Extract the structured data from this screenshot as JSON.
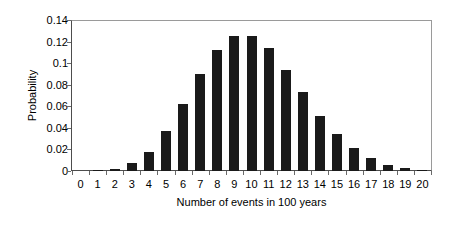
{
  "chart_data": {
    "type": "bar",
    "title": "",
    "xlabel": "Number of events in 100 years",
    "ylabel": "Probability",
    "categories": [
      "0",
      "1",
      "2",
      "3",
      "4",
      "5",
      "6",
      "7",
      "8",
      "9",
      "10",
      "11",
      "12",
      "13",
      "14",
      "15",
      "16",
      "17",
      "18",
      "19",
      "20"
    ],
    "values": [
      0.0,
      0.0005,
      0.002,
      0.007,
      0.018,
      0.037,
      0.062,
      0.09,
      0.112,
      0.125,
      0.125,
      0.114,
      0.094,
      0.073,
      0.051,
      0.034,
      0.021,
      0.012,
      0.006,
      0.003,
      0.001
    ],
    "ylim": [
      0,
      0.14
    ],
    "ytick_labels": [
      "0",
      "0.02",
      "0.04",
      "0.06",
      "0.08",
      "0.1",
      "0.12",
      "0.14"
    ],
    "ytick_values": [
      0,
      0.02,
      0.04,
      0.06,
      0.08,
      0.1,
      0.12,
      0.14
    ],
    "grid": false,
    "legend": false,
    "bar_color": "#1a1a1a",
    "axis_color": "#4d4d4d",
    "background": "#ffffff"
  }
}
